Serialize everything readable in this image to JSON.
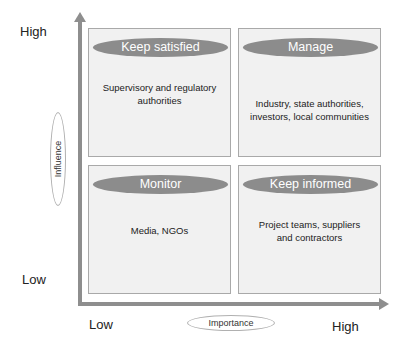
{
  "y_axis": {
    "title": "Influence",
    "high_label": "High",
    "low_label": "Low"
  },
  "x_axis": {
    "title": "Importance",
    "low_label": "Low",
    "high_label": "High"
  },
  "quadrants": [
    {
      "position": "top-left",
      "title": "Keep satisfied",
      "description": "Supervisory and regulatory authorities"
    },
    {
      "position": "top-right",
      "title": "Manage",
      "description": "Industry, state authorities, investors, local communities"
    },
    {
      "position": "bottom-left",
      "title": "Monitor",
      "description": "Media, NGOs"
    },
    {
      "position": "bottom-right",
      "title": "Keep informed",
      "description": "Project teams, suppliers and contractors"
    }
  ],
  "colors": {
    "axis": "#8e8e8e",
    "pill": "#8c8c8c",
    "quadrant_fill": "#f1f1f1",
    "quadrant_border": "#a9a9a9"
  }
}
